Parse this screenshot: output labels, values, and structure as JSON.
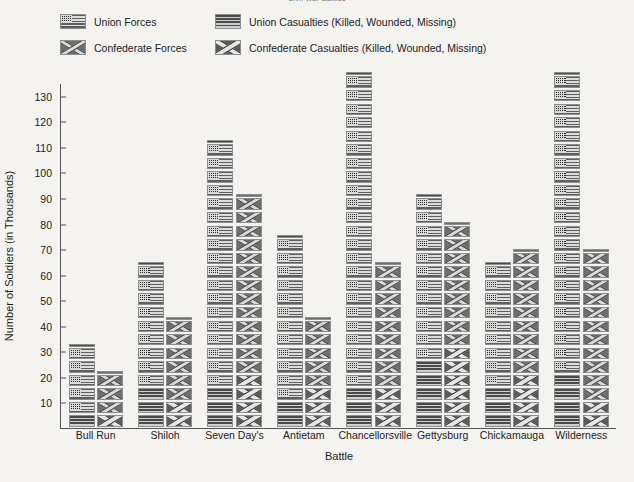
{
  "chart_data": {
    "type": "bar",
    "title": "Civil War Battles",
    "xlabel": "Battle",
    "ylabel": "Number of Soldiers (in Thousands)",
    "ylim": [
      0,
      135
    ],
    "yticks": [
      10,
      20,
      30,
      40,
      50,
      60,
      70,
      80,
      90,
      100,
      110,
      120,
      130
    ],
    "grid": false,
    "legend_position": "top",
    "pictogram": true,
    "icon_unit_value": 5,
    "categories": [
      "Bull Run",
      "Shiloh",
      "Seven Day's",
      "Antietam",
      "Chancellorsville",
      "Gettysburg",
      "Chickamauga",
      "Wilderness"
    ],
    "series": [
      {
        "name": "Union Forces",
        "icon": "union-flag-icon",
        "values": [
          29,
          62,
          104,
          70,
          130,
          83,
          58,
          129
        ]
      },
      {
        "name": "Union Casualties (Killed, Wounded, Missing)",
        "icon": "union-flag-casualty-icon",
        "values": [
          3,
          13,
          16,
          12,
          17,
          23,
          16,
          18
        ]
      },
      {
        "name": "Confederate Forces",
        "icon": "confederate-flag-icon",
        "values": [
          21,
          41,
          85,
          39,
          60,
          75,
          65,
          64
        ]
      },
      {
        "name": "Confederate Casualties (Killed, Wounded, Missing)",
        "icon": "confederate-flag-casualty-icon",
        "values": [
          2,
          11,
          20,
          14,
          13,
          28,
          18,
          11
        ]
      }
    ]
  },
  "legend": {
    "items": [
      {
        "label": "Union Forces",
        "icon": "union-flag-icon",
        "row": 0,
        "col": 0
      },
      {
        "label": "Union Casualties (Killed, Wounded, Missing)",
        "icon": "union-flag-casualty-icon",
        "row": 0,
        "col": 1
      },
      {
        "label": "Confederate Forces",
        "icon": "confederate-flag-icon",
        "row": 1,
        "col": 0
      },
      {
        "label": "Confederate Casualties (Killed, Wounded, Missing)",
        "icon": "confederate-flag-casualty-icon",
        "row": 1,
        "col": 1
      }
    ]
  },
  "colors": {
    "background": "#f4f3f0",
    "axis": "#555555",
    "text": "#1c1c1c",
    "union_stripe_dark": "#5f5f5f",
    "union_stripe_light": "#dcdcdc",
    "union_canton": "#2c2c2c",
    "confederate_field": "#6e6e6e",
    "confederate_saltire": "#d9d9d9"
  }
}
